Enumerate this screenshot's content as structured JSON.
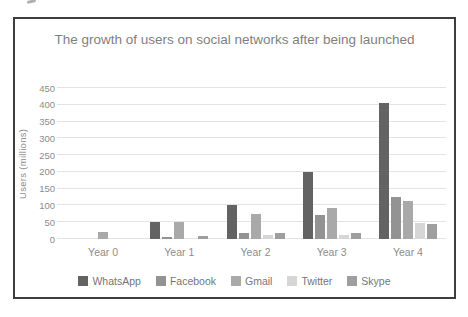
{
  "chart_data": {
    "type": "bar",
    "title": "The growth of users on social networks after being launched",
    "xlabel": "",
    "ylabel": "Users (millions)",
    "categories": [
      "Year 0",
      "Year 1",
      "Year 2",
      "Year 3",
      "Year 4"
    ],
    "series": [
      {
        "name": "WhatsApp",
        "color": "#636363",
        "values": [
          0,
          50,
          100,
          200,
          405
        ]
      },
      {
        "name": "Facebook",
        "color": "#939393",
        "values": [
          0,
          5,
          18,
          72,
          125
        ]
      },
      {
        "name": "Gmail",
        "color": "#a9a9a9",
        "values": [
          20,
          50,
          75,
          92,
          112
        ]
      },
      {
        "name": "Twitter",
        "color": "#d6d6d6",
        "values": [
          0,
          0,
          13,
          12,
          47
        ]
      },
      {
        "name": "Skype",
        "color": "#9e9e9e",
        "values": [
          0,
          8,
          18,
          18,
          45
        ]
      }
    ],
    "ylim": [
      0,
      450
    ],
    "yticks": [
      0,
      50,
      100,
      150,
      200,
      250,
      300,
      350,
      400,
      450
    ],
    "grid": true,
    "legend_position": "bottom"
  },
  "colors": {
    "chart_border": "#3d3d3d",
    "title_text": "#7f7f7f",
    "axis_text": "#8c8c8c",
    "legend_text": "#767676",
    "gridline": "#e3e3e3",
    "background": "#ffffff"
  }
}
